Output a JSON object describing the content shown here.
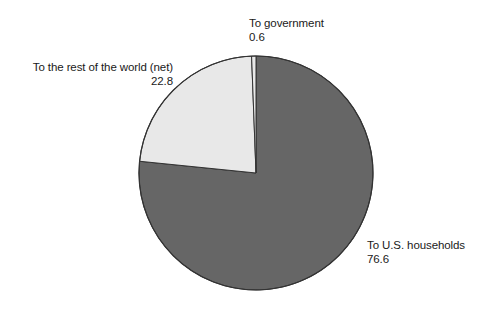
{
  "chart_data": {
    "type": "pie",
    "title": "",
    "subtitle": "",
    "xlabel": "",
    "ylabel": "",
    "legend": "none",
    "grid": false,
    "start_angle_deg": 0,
    "direction": "clockwise",
    "total": 100.0,
    "categories": [
      "To U.S. households",
      "To the rest of the world (net)",
      "To government"
    ],
    "values": [
      76.6,
      22.8,
      0.6
    ],
    "slices": [
      {
        "label": "To U.S. households",
        "value": "76.6",
        "numeric": 76.6,
        "color": "#666666",
        "start_deg": 0.0,
        "end_deg": 275.76
      },
      {
        "label": "To the rest of the world (net)",
        "value": "22.8",
        "numeric": 22.8,
        "color": "#e8e8e8",
        "start_deg": 275.76,
        "end_deg": 357.84
      },
      {
        "label": "To government",
        "value": "0.6",
        "numeric": 0.6,
        "color": "#e8e8e8",
        "start_deg": 357.84,
        "end_deg": 360.0
      }
    ]
  },
  "labels": {
    "government": {
      "name": "To government",
      "value": "0.6"
    },
    "rest_of_world": {
      "name": "To the rest of the world (net)",
      "value": "22.8"
    },
    "us_households": {
      "name": "To U.S. households",
      "value": "76.6"
    }
  },
  "colors": {
    "background": "#ffffff",
    "dark_slice": "#666666",
    "light_slice": "#e8e8e8",
    "outline": "#333333",
    "text": "#1a1a1a"
  },
  "geometry": {
    "center_x": 256,
    "center_y": 173,
    "radius": 117
  }
}
